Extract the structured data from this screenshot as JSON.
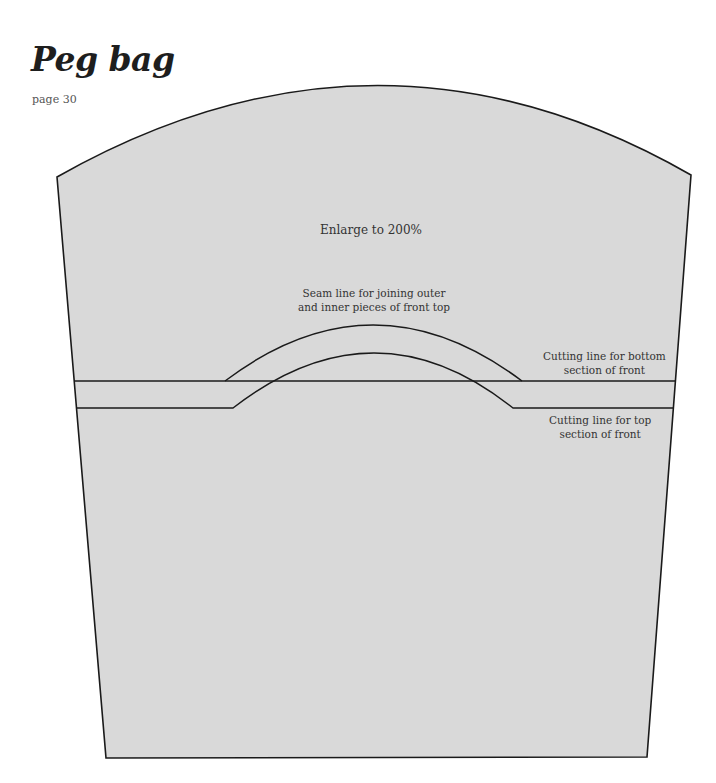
{
  "header": {
    "title": "Peg bag",
    "page_ref": "page 30"
  },
  "pattern": {
    "fill_color": "#d9d9d9",
    "stroke_color": "#1a1a1a",
    "instruction": "Enlarge to 200%",
    "seam_label_line1": "Seam line for joining outer",
    "seam_label_line2": "and inner pieces of front top",
    "cut_bottom_line1": "Cutting line for bottom",
    "cut_bottom_line2": "section of front",
    "cut_top_line1": "Cutting line for top",
    "cut_top_line2": "section of front"
  }
}
